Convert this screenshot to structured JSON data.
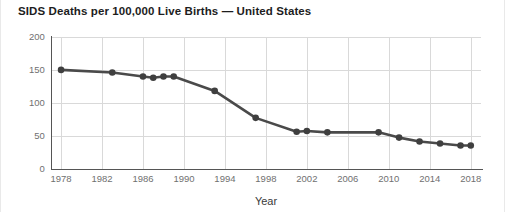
{
  "chart_data": {
    "type": "line",
    "title": "SIDS Deaths per 100,000 Live Births — United States",
    "xlabel": "Year",
    "ylabel": "",
    "xlim": [
      1977,
      2019
    ],
    "ylim": [
      0,
      200
    ],
    "grid": true,
    "legend": false,
    "series": [
      {
        "name": "SIDS death rate",
        "color": "#4a4a4a",
        "points": [
          {
            "x": 1978,
            "y": 150
          },
          {
            "x": 1983,
            "y": 146
          },
          {
            "x": 1986,
            "y": 140
          },
          {
            "x": 1987,
            "y": 138
          },
          {
            "x": 1988,
            "y": 140
          },
          {
            "x": 1989,
            "y": 140
          },
          {
            "x": 1993,
            "y": 118
          },
          {
            "x": 1997,
            "y": 77
          },
          {
            "x": 2001,
            "y": 56
          },
          {
            "x": 2002,
            "y": 57
          },
          {
            "x": 2004,
            "y": 55
          },
          {
            "x": 2009,
            "y": 55
          },
          {
            "x": 2011,
            "y": 47
          },
          {
            "x": 2013,
            "y": 41
          },
          {
            "x": 2015,
            "y": 38
          },
          {
            "x": 2017,
            "y": 35
          },
          {
            "x": 2018,
            "y": 35
          }
        ]
      }
    ],
    "yticks": [
      0,
      50,
      100,
      150,
      200
    ],
    "ytick_labels": [
      "0",
      "50",
      "100",
      "150",
      "200"
    ],
    "xticks": [
      1978,
      1982,
      1986,
      1990,
      1994,
      1998,
      2002,
      2006,
      2010,
      2014,
      2018
    ],
    "xtick_labels": [
      "1978",
      "1982",
      "1986",
      "1990",
      "1994",
      "1998",
      "2002",
      "2006",
      "2010",
      "2014",
      "2018"
    ]
  }
}
